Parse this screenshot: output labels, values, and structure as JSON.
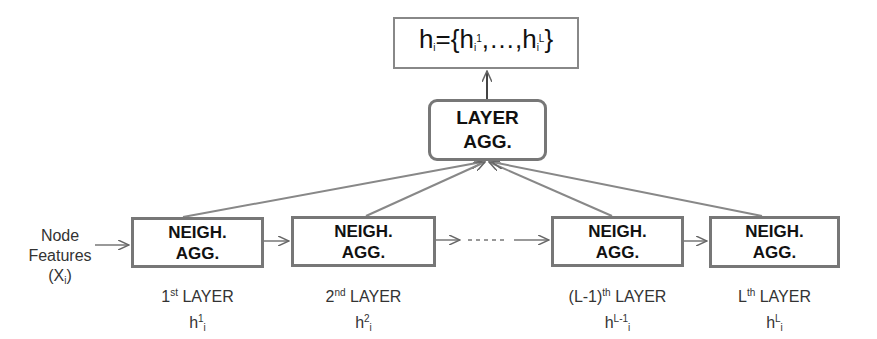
{
  "output_box": {
    "base": "h",
    "sub": "i",
    "eq": "={h",
    "sub2": "i",
    "sup1": "1",
    "mid": ",…,h",
    "sub3": "i",
    "sup2": "L",
    "end": "}"
  },
  "layer_agg": {
    "line1": "LAYER",
    "line2": "AGG."
  },
  "input_label": {
    "line1": "Node",
    "line2": "Features",
    "line3_open": "(X",
    "line3_sub": "i",
    "line3_close": ")"
  },
  "layers": [
    {
      "box_line1": "NEIGH.",
      "box_line2": "AGG.",
      "ordinal_pre": "1",
      "ordinal_sup": "st",
      "layer_word": " LAYER",
      "h_sup": "1",
      "h_sub": "i"
    },
    {
      "box_line1": "NEIGH.",
      "box_line2": "AGG.",
      "ordinal_pre": "2",
      "ordinal_sup": "nd",
      "layer_word": " LAYER",
      "h_sup": "2",
      "h_sub": "i"
    },
    {
      "box_line1": "NEIGH.",
      "box_line2": "AGG.",
      "ordinal_pre": "(L-1)",
      "ordinal_sup": "th",
      "layer_word": " LAYER",
      "h_sup": "L-1",
      "h_sub": "i"
    },
    {
      "box_line1": "NEIGH.",
      "box_line2": "AGG.",
      "ordinal_pre": "L",
      "ordinal_sup": "th",
      "layer_word": " LAYER",
      "h_sup": "L",
      "h_sub": "i"
    }
  ],
  "ellipsis": "……",
  "colors": {
    "box_border": "#777777",
    "arrow": "#777777",
    "text": "#222222"
  }
}
